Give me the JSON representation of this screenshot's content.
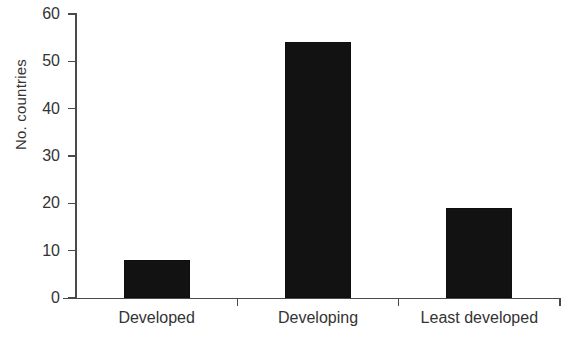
{
  "chart_data": {
    "type": "bar",
    "title": "",
    "subtitle": "",
    "xlabel": "",
    "ylabel": "No. countries",
    "categories": [
      "Developed",
      "Developing",
      "Least developed"
    ],
    "values": [
      8,
      54,
      19
    ],
    "ylim": [
      0,
      60
    ],
    "yticks": [
      0,
      10,
      20,
      30,
      40,
      50,
      60
    ],
    "ytick_labels": [
      "0",
      "10",
      "20",
      "30",
      "40",
      "50",
      "60"
    ],
    "grid": false,
    "legend": false,
    "legend_position": "none",
    "bar_color": "#121212",
    "axis_color": "#4a4a4a",
    "background_color": "#ffffff"
  },
  "axis": {
    "y_title": "No. countries",
    "ticks": [
      {
        "label": "60",
        "value": 60
      },
      {
        "label": "50",
        "value": 50
      },
      {
        "label": "40",
        "value": 40
      },
      {
        "label": "30",
        "value": 30
      },
      {
        "label": "20",
        "value": 20
      },
      {
        "label": "10",
        "value": 10
      },
      {
        "label": "0",
        "value": 0
      }
    ]
  },
  "categories": [
    {
      "label": "Developed",
      "value": 8
    },
    {
      "label": "Developing",
      "value": 54
    },
    {
      "label": "Least developed",
      "value": 19
    }
  ]
}
